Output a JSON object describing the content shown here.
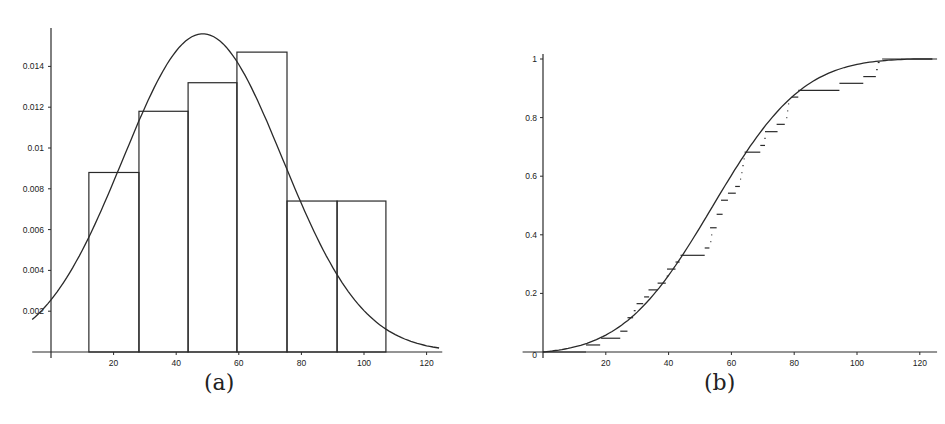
{
  "chart_data": [
    {
      "id": "a",
      "type": "bar",
      "subtype": "histogram_with_density_curve",
      "caption": "(a)",
      "title": "",
      "xlabel": "",
      "ylabel": "",
      "xlim": [
        -6,
        125
      ],
      "ylim": [
        0,
        0.016
      ],
      "grid": false,
      "legend": null,
      "x_ticks": [
        20,
        40,
        60,
        80,
        100,
        120
      ],
      "y_ticks": [
        0.002,
        0.004,
        0.006,
        0.008,
        0.01,
        0.012,
        0.014
      ],
      "y_tick_labels": [
        "0.002",
        "0.004",
        "0.006",
        "0.008",
        "0.01",
        "0.012",
        "0.014"
      ],
      "bins": [
        {
          "x0": 12.1,
          "x1": 28.1,
          "height": 0.0088
        },
        {
          "x0": 28.1,
          "x1": 43.8,
          "height": 0.0118
        },
        {
          "x0": 43.8,
          "x1": 59.4,
          "height": 0.0132
        },
        {
          "x0": 59.4,
          "x1": 75.4,
          "height": 0.0147
        },
        {
          "x0": 75.4,
          "x1": 91.4,
          "height": 0.0074
        },
        {
          "x0": 91.4,
          "x1": 107.0,
          "height": 0.0074
        }
      ],
      "series": [
        {
          "name": "fitted density",
          "kind": "smooth curve",
          "x": [
            -6,
            0,
            10,
            20,
            30,
            40,
            48,
            55,
            60,
            70,
            80,
            90,
            100,
            110,
            120,
            124
          ],
          "values": [
            0.0003,
            0.0005,
            0.0019,
            0.0052,
            0.0099,
            0.0142,
            0.0156,
            0.0152,
            0.0143,
            0.0114,
            0.0079,
            0.0048,
            0.0026,
            0.0012,
            0.0005,
            0.0004
          ]
        }
      ]
    },
    {
      "id": "b",
      "type": "line",
      "subtype": "empirical_cdf_vs_fitted_cdf",
      "caption": "(b)",
      "title": "",
      "xlabel": "",
      "ylabel": "",
      "xlim": [
        -20,
        125
      ],
      "ylim": [
        0,
        1
      ],
      "grid": false,
      "legend": null,
      "x_ticks": [
        20,
        40,
        60,
        80,
        100,
        120
      ],
      "y_ticks": [
        0,
        0.2,
        0.4,
        0.6,
        0.8,
        1
      ],
      "y_tick_labels": [
        "0",
        "0.2",
        "0.4",
        "0.6",
        "0.8",
        "1"
      ],
      "series": [
        {
          "name": "fitted CDF",
          "kind": "smooth curve",
          "x": [
            0,
            5,
            10,
            15,
            20,
            25,
            30,
            35,
            40,
            45,
            50,
            55,
            60,
            65,
            70,
            75,
            80,
            85,
            90,
            95,
            100,
            105,
            110,
            115,
            120,
            124
          ],
          "values": [
            0.0,
            0.004,
            0.012,
            0.024,
            0.045,
            0.075,
            0.12,
            0.18,
            0.25,
            0.33,
            0.42,
            0.51,
            0.6,
            0.68,
            0.755,
            0.82,
            0.87,
            0.91,
            0.945,
            0.968,
            0.983,
            0.992,
            0.997,
            0.999,
            1.0,
            1.0
          ]
        },
        {
          "name": "empirical CDF",
          "kind": "step segments",
          "segments": [
            {
              "x0": 0,
              "x1": 13.7,
              "y": 0.0
            },
            {
              "x0": 13.7,
              "x1": 18.2,
              "y": 0.024
            },
            {
              "x0": 18.5,
              "x1": 24.6,
              "y": 0.047
            },
            {
              "x0": 24.6,
              "x1": 26.9,
              "y": 0.071
            },
            {
              "x0": 26.9,
              "x1": 28.7,
              "y": 0.117
            },
            {
              "x0": 28.9,
              "x1": 29.5,
              "y": 0.141
            },
            {
              "x0": 29.8,
              "x1": 31.9,
              "y": 0.165
            },
            {
              "x0": 32.2,
              "x1": 33.8,
              "y": 0.188
            },
            {
              "x0": 33.6,
              "x1": 36.5,
              "y": 0.212
            },
            {
              "x0": 36.5,
              "x1": 39.1,
              "y": 0.235
            },
            {
              "x0": 39.4,
              "x1": 39.9,
              "y": 0.259
            },
            {
              "x0": 39.5,
              "x1": 42.2,
              "y": 0.283
            },
            {
              "x0": 42.2,
              "x1": 43.5,
              "y": 0.307
            },
            {
              "x0": 43.8,
              "x1": 51.5,
              "y": 0.33
            },
            {
              "x0": 51.5,
              "x1": 53.0,
              "y": 0.355
            },
            {
              "x0": 53.3,
              "x1": 53.6,
              "y": 0.377
            },
            {
              "x0": 53.6,
              "x1": 53.9,
              "y": 0.4
            },
            {
              "x0": 53.2,
              "x1": 55.3,
              "y": 0.424
            },
            {
              "x0": 55.3,
              "x1": 57.2,
              "y": 0.47
            },
            {
              "x0": 56.7,
              "x1": 58.9,
              "y": 0.518
            },
            {
              "x0": 58.9,
              "x1": 61.4,
              "y": 0.542
            },
            {
              "x0": 61.2,
              "x1": 62.7,
              "y": 0.565
            },
            {
              "x0": 62.8,
              "x1": 63.1,
              "y": 0.59
            },
            {
              "x0": 63.2,
              "x1": 63.5,
              "y": 0.612
            },
            {
              "x0": 63.5,
              "x1": 63.9,
              "y": 0.636
            },
            {
              "x0": 63.9,
              "x1": 64.2,
              "y": 0.659
            },
            {
              "x0": 64.2,
              "x1": 69.2,
              "y": 0.682
            },
            {
              "x0": 69.2,
              "x1": 70.7,
              "y": 0.705
            },
            {
              "x0": 70.5,
              "x1": 70.9,
              "y": 0.729
            },
            {
              "x0": 70.7,
              "x1": 74.7,
              "y": 0.752
            },
            {
              "x0": 74.4,
              "x1": 77.0,
              "y": 0.777
            },
            {
              "x0": 77.5,
              "x1": 77.8,
              "y": 0.8
            },
            {
              "x0": 77.8,
              "x1": 78.1,
              "y": 0.823
            },
            {
              "x0": 78.1,
              "x1": 78.4,
              "y": 0.847
            },
            {
              "x0": 79.2,
              "x1": 81.3,
              "y": 0.87
            },
            {
              "x0": 81.3,
              "x1": 94.4,
              "y": 0.893
            },
            {
              "x0": 94.4,
              "x1": 102.0,
              "y": 0.917
            },
            {
              "x0": 102.0,
              "x1": 106.0,
              "y": 0.94
            },
            {
              "x0": 106.1,
              "x1": 106.6,
              "y": 0.964
            },
            {
              "x0": 106.6,
              "x1": 107.2,
              "y": 0.988
            },
            {
              "x0": 108.0,
              "x1": 125.5,
              "y": 1.0
            }
          ]
        }
      ]
    }
  ],
  "captions": {
    "a": "(a)",
    "b": "(b)"
  }
}
